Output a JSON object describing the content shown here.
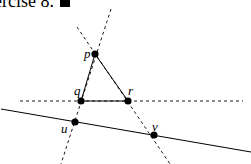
{
  "caption": {
    "text": "ercise 8.",
    "end_marker": "qed-square"
  },
  "diagram": {
    "points": [
      {
        "id": "p",
        "label": "p"
      },
      {
        "id": "q",
        "label": "q"
      },
      {
        "id": "r",
        "label": "r"
      },
      {
        "id": "u",
        "label": "u"
      },
      {
        "id": "v",
        "label": "v"
      }
    ],
    "triangle": [
      "p",
      "q",
      "r"
    ],
    "solid_line": [
      "u",
      "v"
    ],
    "dashed_lines": [
      [
        "p",
        "q"
      ],
      [
        "p",
        "r"
      ],
      [
        "q",
        "r"
      ]
    ],
    "colors": {
      "ink": "#000000",
      "background": "#ffffff"
    }
  }
}
